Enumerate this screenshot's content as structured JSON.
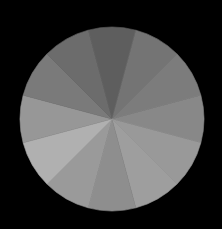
{
  "canvas": {
    "width": 222,
    "height": 229,
    "background": "#000000"
  },
  "disc": {
    "center": [
      112,
      119
    ],
    "radius": 92,
    "wedge_count": 12,
    "start_angle_deg": -15,
    "wedges": [
      {
        "index": 0,
        "center_angle_deg": 0,
        "color": "#5e5e5e"
      },
      {
        "index": 1,
        "center_angle_deg": 30,
        "color": "#747474"
      },
      {
        "index": 2,
        "center_angle_deg": 60,
        "color": "#7c7c7c"
      },
      {
        "index": 3,
        "center_angle_deg": 90,
        "color": "#888888"
      },
      {
        "index": 4,
        "center_angle_deg": 120,
        "color": "#999999"
      },
      {
        "index": 5,
        "center_angle_deg": 150,
        "color": "#9e9e9e"
      },
      {
        "index": 6,
        "center_angle_deg": 180,
        "color": "#8e8e8e"
      },
      {
        "index": 7,
        "center_angle_deg": 210,
        "color": "#9a9a9a"
      },
      {
        "index": 8,
        "center_angle_deg": 240,
        "color": "#b0b0b0"
      },
      {
        "index": 9,
        "center_angle_deg": 270,
        "color": "#979797"
      },
      {
        "index": 10,
        "center_angle_deg": 300,
        "color": "#7a7a7a"
      },
      {
        "index": 11,
        "center_angle_deg": 330,
        "color": "#6c6c6c"
      }
    ]
  }
}
